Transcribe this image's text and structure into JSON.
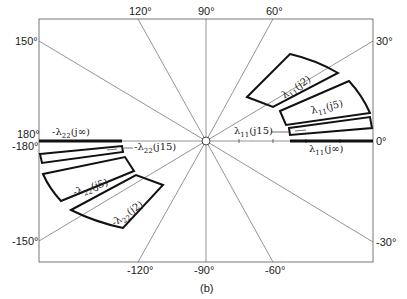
{
  "figure": {
    "caption": "(b)",
    "angle_labels": {
      "top": [
        "120°",
        "90°",
        "60°"
      ],
      "right": [
        "30°",
        "0°",
        "-30°"
      ],
      "bottom": [
        "-120°",
        "-90°",
        "-60°"
      ],
      "left": [
        "150°",
        "180°",
        "-180°",
        "-150°"
      ]
    },
    "curve_labels": {
      "l11_j2": {
        "sym": "λ",
        "sub": "11",
        "arg": "(j2)"
      },
      "l11_j5": {
        "sym": "λ",
        "sub": "11",
        "arg": "(j5)"
      },
      "l11_j15": {
        "sym": "λ",
        "sub": "11",
        "arg": "(j15)"
      },
      "l11_jinf": {
        "sym": "λ",
        "sub": "11",
        "arg": "(j∞)"
      },
      "l22_jinf": {
        "sym": "-λ",
        "sub": "22",
        "arg": "(j∞)"
      },
      "l22_j15": {
        "sym": "-λ",
        "sub": "22",
        "arg": "(j15)"
      },
      "l22_j5": {
        "sym": "-λ",
        "sub": "22",
        "arg": "(j5)"
      },
      "l22_j2": {
        "sym": "-λ",
        "sub": "22",
        "arg": "(j2)"
      }
    }
  }
}
